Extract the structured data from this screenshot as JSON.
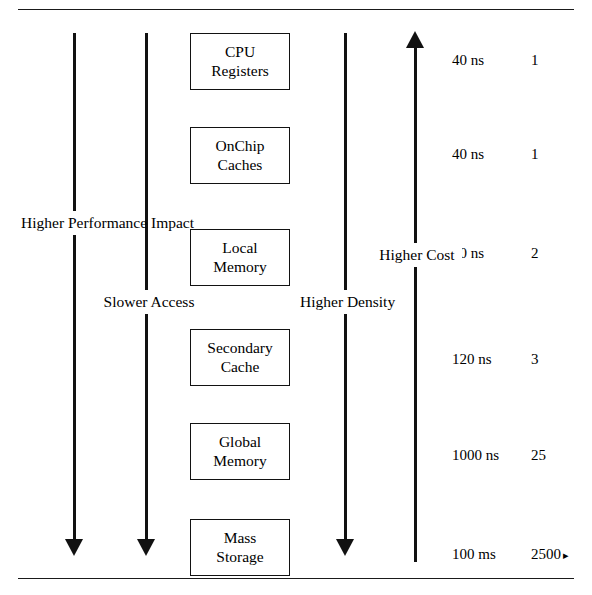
{
  "diagram": {
    "axes": [
      {
        "name": "performance-impact",
        "label_lines": [
          "Higher",
          "Performance",
          "Impact"
        ],
        "direction": "down",
        "x": 73,
        "label_top": 211
      },
      {
        "name": "access-speed",
        "label_lines": [
          "Slower",
          "Access"
        ],
        "direction": "down",
        "x": 145,
        "label_top": 290
      },
      {
        "name": "density",
        "label_lines": [
          "Higher",
          "Density"
        ],
        "direction": "down",
        "x": 344,
        "label_top": 290
      },
      {
        "name": "cost",
        "label_lines": [
          "Higher",
          "Cost"
        ],
        "direction": "up",
        "x": 414,
        "label_top": 243
      }
    ],
    "levels": [
      {
        "name": "cpu-registers",
        "line1": "CPU",
        "line2": "Registers",
        "latency": "40 ns",
        "ratio": "1",
        "ratio_mark": "",
        "top": 33
      },
      {
        "name": "onchip-caches",
        "line1": "OnChip",
        "line2": "Caches",
        "latency": "40 ns",
        "ratio": "1",
        "ratio_mark": "",
        "top": 127
      },
      {
        "name": "local-memory",
        "line1": "Local",
        "line2": "Memory",
        "latency": "80 ns",
        "ratio": "2",
        "ratio_mark": "",
        "top": 229
      },
      {
        "name": "secondary-cache",
        "line1": "Secondary",
        "line2": "Cache",
        "latency": "120 ns",
        "ratio": "3",
        "ratio_mark": "",
        "top": 329
      },
      {
        "name": "global-memory",
        "line1": "Global",
        "line2": "Memory",
        "latency": "1000 ns",
        "ratio": "25",
        "ratio_mark": "",
        "top": 423
      },
      {
        "name": "mass-storage",
        "line1": "Mass",
        "line2": "Storage",
        "latency": "100 ms",
        "ratio": "2500",
        "ratio_mark": "▸",
        "top": 519
      }
    ],
    "metric_rows": [
      {
        "latency": "40 ns",
        "ratio": "1",
        "ratio_mark": "",
        "top": 52
      },
      {
        "latency": "40 ns",
        "ratio": "1",
        "ratio_mark": "",
        "top": 146
      },
      {
        "latency": "80 ns",
        "ratio": "2",
        "ratio_mark": "",
        "top": 245
      },
      {
        "latency": "120 ns",
        "ratio": "3",
        "ratio_mark": "",
        "top": 351
      },
      {
        "latency": "1000 ns",
        "ratio": "25",
        "ratio_mark": "",
        "top": 447
      },
      {
        "latency": "100 ms",
        "ratio": "2500",
        "ratio_mark": "▸",
        "top": 546
      }
    ],
    "colors": {
      "ink": "#111111",
      "rule": "#1a1a1a",
      "background": "#ffffff"
    }
  }
}
